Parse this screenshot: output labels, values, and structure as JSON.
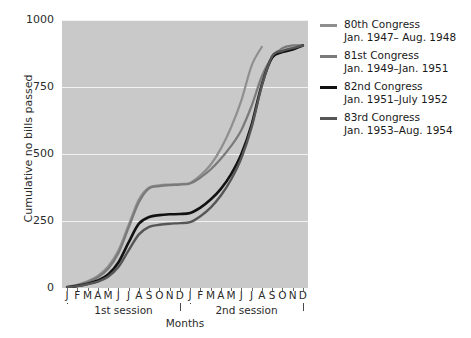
{
  "chart_data": {
    "type": "line",
    "title": "",
    "xlabel": "Months",
    "ylabel": "Cumulative no bills passed",
    "ylim": [
      0,
      1000
    ],
    "yticks": [
      0,
      250,
      500,
      750,
      1000
    ],
    "grid": "horizontal-only",
    "legend_position": "right",
    "x": [
      "J",
      "F",
      "M",
      "A",
      "M",
      "J",
      "J",
      "A",
      "S",
      "O",
      "N",
      "D",
      "J",
      "F",
      "M",
      "A",
      "M",
      "J",
      "J",
      "A",
      "S",
      "O",
      "N",
      "D"
    ],
    "x_groups": [
      {
        "label": "1st session",
        "from": "J",
        "to": "D",
        "index_from": 0,
        "index_to": 11
      },
      {
        "label": "2nd session",
        "from": "J",
        "to": "D",
        "index_from": 12,
        "index_to": 23
      }
    ],
    "series": [
      {
        "name": "80th Congress",
        "dates": "Jan. 1947– Aug. 1948",
        "color": "#8f8f8f",
        "width": 2.2,
        "values": [
          5,
          12,
          25,
          45,
          80,
          140,
          235,
          330,
          375,
          383,
          386,
          388,
          392,
          420,
          460,
          520,
          600,
          700,
          830,
          900,
          null,
          null,
          null,
          null
        ]
      },
      {
        "name": "81st Congress",
        "dates": "Jan. 1949–Jan. 1951",
        "color": "#7a7a7a",
        "width": 2.2,
        "values": [
          4,
          10,
          22,
          40,
          72,
          130,
          225,
          320,
          372,
          380,
          384,
          386,
          390,
          412,
          442,
          482,
          530,
          590,
          680,
          790,
          860,
          895,
          905,
          905
        ]
      },
      {
        "name": "82nd Congress",
        "dates": "Jan. 1951–July 1952",
        "color": "#121212",
        "width": 2.6,
        "values": [
          3,
          8,
          16,
          28,
          50,
          95,
          170,
          240,
          265,
          272,
          275,
          276,
          280,
          300,
          330,
          370,
          425,
          500,
          610,
          760,
          860,
          880,
          890,
          905
        ]
      },
      {
        "name": "83rd Congress",
        "dates": "Jan. 1953–Aug. 1954",
        "color": "#565656",
        "width": 2.4,
        "values": [
          3,
          7,
          14,
          24,
          42,
          78,
          140,
          200,
          228,
          236,
          240,
          242,
          246,
          268,
          300,
          345,
          405,
          485,
          600,
          755,
          865,
          885,
          895,
          905
        ]
      }
    ]
  },
  "axes": {
    "y_label": "Cumulative no bills passed",
    "y_ticks": [
      "0",
      "250",
      "500",
      "750",
      "1000"
    ],
    "x_label": "Months",
    "x_ticks": [
      "J",
      "F",
      "M",
      "A",
      "M",
      "J",
      "J",
      "A",
      "S",
      "O",
      "N",
      "D",
      "J",
      "F",
      "M",
      "A",
      "M",
      "J",
      "J",
      "A",
      "S",
      "O",
      "N",
      "D"
    ],
    "session_1": "1st session",
    "session_2": "2nd session"
  },
  "legend": {
    "items": [
      {
        "name": "80th Congress",
        "dates": "Jan. 1947– Aug. 1948",
        "color": "#8f8f8f"
      },
      {
        "name": "81st Congress",
        "dates": "Jan. 1949–Jan. 1951",
        "color": "#7a7a7a"
      },
      {
        "name": "82nd Congress",
        "dates": "Jan. 1951–July 1952",
        "color": "#121212"
      },
      {
        "name": "83rd Congress",
        "dates": "Jan. 1953–Aug. 1954",
        "color": "#565656"
      }
    ]
  },
  "style": {
    "plot_background": "#c9c9c9",
    "gridline_color": "#f2f2f2",
    "page_background": "#ffffff",
    "text_color": "#2b2b2b"
  }
}
